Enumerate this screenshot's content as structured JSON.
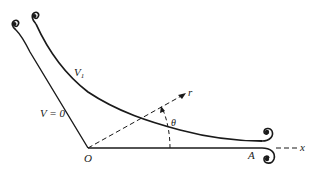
{
  "diagram": {
    "labels": {
      "v_zero": "V = 0",
      "v_one": "V",
      "v_one_sub": "1",
      "origin": "O",
      "point_a": "A",
      "axis_x": "x",
      "axis_r": "r",
      "angle": "θ"
    },
    "colors": {
      "stroke": "#1a1a1a",
      "background": "#ffffff"
    }
  }
}
